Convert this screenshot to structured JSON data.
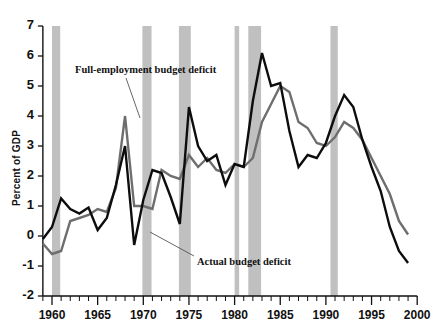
{
  "chart_data": {
    "type": "line",
    "title": "",
    "xlabel": "",
    "ylabel": "Percent of GDP",
    "xlim": [
      1959,
      2000
    ],
    "ylim": [
      -2,
      7
    ],
    "yticks": [
      7,
      6,
      5,
      4,
      3,
      2,
      1,
      0,
      -1,
      -2
    ],
    "ytick_labels": [
      "7",
      "6",
      "5",
      "4",
      "3",
      "2",
      "1",
      "0",
      "-1",
      "-2"
    ],
    "xticks": [
      1960,
      1965,
      1970,
      1975,
      1980,
      1985,
      1990,
      1995,
      2000
    ],
    "xtick_labels": [
      "1960",
      "1965",
      "1970",
      "1975",
      "1980",
      "1985",
      "1990",
      "1995",
      "2000"
    ],
    "minor_xtick_interval": 1,
    "grid": false,
    "legend_position": "annotations",
    "series": [
      {
        "name": "Full-employment budget deficit",
        "color": "#6e6e6e",
        "width": 2.4,
        "x": [
          1959,
          1960,
          1961,
          1962,
          1963,
          1964,
          1965,
          1966,
          1967,
          1968,
          1969,
          1970,
          1971,
          1972,
          1973,
          1974,
          1975,
          1976,
          1977,
          1978,
          1979,
          1980,
          1981,
          1982,
          1983,
          1984,
          1985,
          1986,
          1987,
          1988,
          1989,
          1990,
          1991,
          1992,
          1993,
          1994,
          1995,
          1996,
          1997,
          1998,
          1999
        ],
        "values": [
          -0.25,
          -0.6,
          -0.5,
          0.5,
          0.6,
          0.7,
          0.9,
          0.8,
          1.6,
          4.0,
          1.0,
          1.0,
          0.9,
          2.2,
          2.0,
          1.9,
          2.7,
          2.3,
          2.6,
          2.2,
          2.1,
          2.4,
          2.3,
          2.6,
          3.8,
          4.4,
          5.0,
          4.8,
          3.8,
          3.6,
          3.1,
          3.0,
          3.3,
          3.8,
          3.6,
          3.2,
          2.6,
          2.0,
          1.4,
          0.5,
          0.05
        ]
      },
      {
        "name": "Actual budget deficit",
        "color": "#0d0d0d",
        "width": 2.4,
        "x": [
          1959,
          1960,
          1961,
          1962,
          1963,
          1964,
          1965,
          1966,
          1967,
          1968,
          1969,
          1970,
          1971,
          1972,
          1973,
          1974,
          1975,
          1976,
          1977,
          1978,
          1979,
          1980,
          1981,
          1982,
          1983,
          1984,
          1985,
          1986,
          1987,
          1988,
          1989,
          1990,
          1991,
          1992,
          1993,
          1994,
          1995,
          1996,
          1997,
          1998,
          1999
        ],
        "values": [
          -0.1,
          0.3,
          1.25,
          0.9,
          0.75,
          0.95,
          0.2,
          0.6,
          1.7,
          3.0,
          -0.3,
          1.2,
          2.2,
          2.1,
          1.3,
          0.4,
          4.3,
          3.0,
          2.5,
          2.7,
          1.7,
          2.4,
          2.3,
          4.5,
          6.1,
          5.0,
          5.1,
          3.5,
          2.3,
          2.7,
          2.6,
          3.1,
          4.0,
          4.7,
          4.3,
          3.2,
          2.3,
          1.5,
          0.3,
          -0.5,
          -0.9
        ]
      }
    ],
    "shaded_bands": {
      "label": "recession",
      "color": "#c0c0c0",
      "ranges": [
        [
          1960.0,
          1960.9
        ],
        [
          1969.9,
          1970.9
        ],
        [
          1973.9,
          1975.2
        ],
        [
          1980.0,
          1980.5
        ],
        [
          1981.5,
          1982.9
        ],
        [
          1990.5,
          1991.3
        ]
      ]
    },
    "annotations": [
      {
        "text": "Full-employment budget deficit",
        "x_px": 75,
        "y_px": 64,
        "leader_from": [
          126,
          78
        ],
        "leader_to": [
          140,
          118
        ]
      },
      {
        "text": "Actual budget deficit",
        "x_px": 197,
        "y_px": 256,
        "leader_from": [
          194,
          256
        ],
        "leader_to": [
          150,
          232
        ]
      }
    ]
  }
}
